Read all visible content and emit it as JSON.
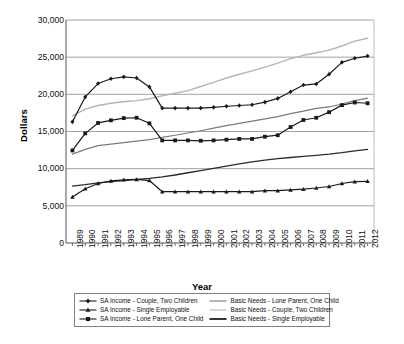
{
  "axes": {
    "y_title": "Dollars",
    "x_title": "Year",
    "y_ticks": [
      "0",
      "5,000",
      "10,000",
      "15,000",
      "20,000",
      "25,000",
      "30,000"
    ],
    "x_ticks": [
      "1989",
      "1990",
      "1991",
      "1992",
      "1993",
      "1994",
      "1995",
      "1996",
      "1997",
      "1998",
      "1999",
      "2000",
      "2001",
      "2002",
      "2003",
      "2004",
      "2005",
      "2006",
      "2007",
      "2008",
      "2009",
      "2010",
      "2011",
      "2012"
    ]
  },
  "legend": {
    "items": [
      {
        "label": "SA Income - Couple, Two Children",
        "marker": "diamond-marker",
        "color": "#1a1a1a",
        "column": 0
      },
      {
        "label": "SA Income - Single Employable",
        "marker": "triangle-marker",
        "color": "#1a1a1a",
        "column": 0
      },
      {
        "label": "SA Income - Lone Parent, One Child",
        "marker": "square-marker",
        "color": "#1a1a1a",
        "column": 0
      },
      {
        "label": "Basic Needs - Lone Parent, One Child",
        "marker": "line-swatch",
        "color": "#7a7a7a",
        "column": 1
      },
      {
        "label": "Basic Needs - Couple, Two Children",
        "marker": "line-swatch",
        "color": "#b5b5b5",
        "column": 1
      },
      {
        "label": "Basic Needs - Single Employable",
        "marker": "line-swatch",
        "color": "#2b2b2b",
        "column": 1
      }
    ]
  },
  "chart_data": {
    "type": "line",
    "title": "",
    "xlabel": "Year",
    "ylabel": "Dollars",
    "ylim": [
      0,
      30000
    ],
    "ytick_step": 5000,
    "grid": "horizontal",
    "legend_position": "bottom",
    "x": [
      1989,
      1990,
      1991,
      1992,
      1993,
      1994,
      1995,
      1996,
      1997,
      1998,
      1999,
      2000,
      2001,
      2002,
      2003,
      2004,
      2005,
      2006,
      2007,
      2008,
      2009,
      2010,
      2011,
      2012
    ],
    "series": [
      {
        "name": "SA Income - Couple, Two Children",
        "marker": "diamond",
        "color": "#1a1a1a",
        "width": 1.2,
        "values": [
          16300,
          19650,
          21450,
          22100,
          22350,
          22200,
          21000,
          18150,
          18150,
          18150,
          18150,
          18250,
          18400,
          18500,
          18600,
          18950,
          19450,
          20350,
          21250,
          21400,
          22700,
          24300,
          24850,
          25150
        ]
      },
      {
        "name": "SA Income - Lone Parent, One Child",
        "marker": "square",
        "color": "#1a1a1a",
        "width": 1.2,
        "values": [
          12450,
          14750,
          16150,
          16500,
          16800,
          16850,
          16100,
          13800,
          13800,
          13800,
          13750,
          13800,
          13900,
          14000,
          14000,
          14300,
          14500,
          15600,
          16550,
          16850,
          17600,
          18550,
          18900,
          18800
        ]
      },
      {
        "name": "SA Income - Single Employable",
        "marker": "triangle",
        "color": "#1a1a1a",
        "width": 1.2,
        "values": [
          6200,
          7300,
          8000,
          8350,
          8500,
          8550,
          8400,
          6900,
          6900,
          6900,
          6900,
          6900,
          6900,
          6900,
          6900,
          7050,
          7050,
          7150,
          7250,
          7400,
          7600,
          8000,
          8250,
          8300
        ]
      },
      {
        "name": "Basic Needs - Couple, Two Children",
        "marker": "none",
        "color": "#b5b5b5",
        "width": 1.4,
        "values": [
          17100,
          18000,
          18500,
          18800,
          19000,
          19150,
          19400,
          19800,
          20150,
          20500,
          21050,
          21600,
          22200,
          22700,
          23150,
          23650,
          24200,
          24800,
          25250,
          25600,
          25950,
          26500,
          27150,
          27550
        ]
      },
      {
        "name": "Basic Needs - Lone Parent, One Child",
        "marker": "none",
        "color": "#7a7a7a",
        "width": 1.2,
        "values": [
          11950,
          12600,
          13100,
          13300,
          13500,
          13700,
          13900,
          14200,
          14500,
          14800,
          15100,
          15450,
          15800,
          16100,
          16400,
          16700,
          17000,
          17400,
          17750,
          18100,
          18300,
          18700,
          19150,
          19500
        ]
      },
      {
        "name": "Basic Needs - Single Employable",
        "marker": "none",
        "color": "#2b2b2b",
        "width": 1.3,
        "values": [
          7650,
          7850,
          8100,
          8250,
          8400,
          8550,
          8700,
          8900,
          9150,
          9450,
          9750,
          10050,
          10350,
          10650,
          10900,
          11150,
          11350,
          11500,
          11650,
          11800,
          11950,
          12150,
          12400,
          12600
        ]
      }
    ]
  }
}
